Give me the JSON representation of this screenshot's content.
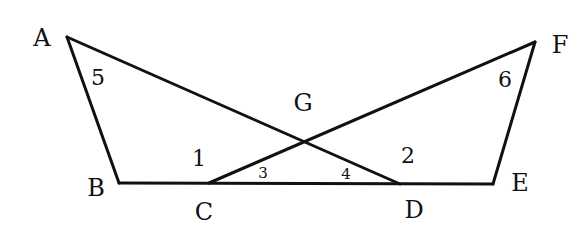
{
  "diagram": {
    "type": "geometry",
    "points": {
      "A": {
        "label": "A",
        "x": 67,
        "y": 37,
        "lx": 42,
        "ly": 46
      },
      "B": {
        "label": "B",
        "x": 119,
        "y": 183,
        "lx": 96,
        "ly": 196
      },
      "C": {
        "label": "C",
        "x": 209,
        "y": 183,
        "lx": 204,
        "ly": 220
      },
      "D": {
        "label": "D",
        "x": 400,
        "y": 184,
        "lx": 414,
        "ly": 218
      },
      "E": {
        "label": "E",
        "x": 493,
        "y": 184,
        "lx": 520,
        "ly": 191
      },
      "F": {
        "label": "F",
        "x": 535,
        "y": 42,
        "lx": 560,
        "ly": 53
      },
      "G": {
        "label": "G",
        "x": 303,
        "y": 141,
        "lx": 303,
        "ly": 111
      }
    },
    "segments": [
      [
        "A",
        "B"
      ],
      [
        "B",
        "E"
      ],
      [
        "E",
        "F"
      ],
      [
        "A",
        "D"
      ],
      [
        "F",
        "C"
      ]
    ],
    "angles": [
      {
        "label": "5",
        "x": 98,
        "y": 85,
        "size": "large"
      },
      {
        "label": "6",
        "x": 505,
        "y": 87,
        "size": "large"
      },
      {
        "label": "1",
        "x": 199,
        "y": 166,
        "size": "large"
      },
      {
        "label": "2",
        "x": 408,
        "y": 163,
        "size": "large"
      },
      {
        "label": "3",
        "x": 263,
        "y": 178,
        "size": "small"
      },
      {
        "label": "4",
        "x": 346,
        "y": 179,
        "size": "small"
      }
    ],
    "colors": {
      "stroke": "#111111",
      "background": "#ffffff"
    }
  }
}
